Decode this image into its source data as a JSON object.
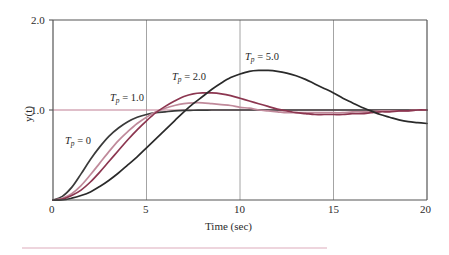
{
  "figure": {
    "background": "#ffffff",
    "axis_color": "#555555",
    "grid_color": "#9a9a9a",
    "reference_line_color": "#c07f93",
    "footer_rule_color": "#e9c7d2"
  },
  "axes": {
    "x_title": "Time (sec)",
    "y_title": "y(t)",
    "x_ticks": [
      "0",
      "5",
      "10",
      "15",
      "20"
    ],
    "y_ticks": [
      "1.0",
      "2.0"
    ]
  },
  "curve_labels": [
    {
      "id": "tp0",
      "prefix": "T",
      "sub": "p",
      "eq": " = 0",
      "x": 65,
      "y": 135
    },
    {
      "id": "tp1",
      "prefix": "T",
      "sub": "p",
      "eq": " = 1.0",
      "x": 110,
      "y": 92
    },
    {
      "id": "tp2",
      "prefix": "T",
      "sub": "p",
      "eq": " = 2.0",
      "x": 172,
      "y": 71
    },
    {
      "id": "tp5",
      "prefix": "T",
      "sub": "p",
      "eq": " = 5.0",
      "x": 245,
      "y": 51
    }
  ],
  "chart_data": {
    "type": "line",
    "title": "",
    "xlabel": "Time (sec)",
    "ylabel": "y(t)",
    "xlim": [
      0,
      20
    ],
    "ylim": [
      0,
      2.0
    ],
    "xticks": [
      0,
      5,
      10,
      15,
      20
    ],
    "yticks": [
      1.0,
      2.0
    ],
    "grid": "vertical gridlines at x = 5, 10, 15",
    "legend": "inline curve annotations",
    "reference_lines": [
      {
        "name": "unity-reference",
        "y": 1.0,
        "color": "#c07f93"
      }
    ],
    "x": [
      0,
      0.5,
      1,
      1.5,
      2,
      2.5,
      3,
      3.5,
      4,
      4.5,
      5,
      5.5,
      6,
      6.5,
      7,
      7.5,
      8,
      8.5,
      9,
      9.5,
      10,
      10.5,
      11,
      11.5,
      12,
      12.5,
      13,
      13.5,
      14,
      14.5,
      15,
      15.5,
      16,
      16.5,
      17,
      17.5,
      18,
      18.5,
      19,
      19.5,
      20
    ],
    "series": [
      {
        "name": "Tp = 0",
        "label": "T_p = 0",
        "color": "#3a3a3a",
        "values": [
          0,
          0.04,
          0.14,
          0.29,
          0.45,
          0.59,
          0.71,
          0.8,
          0.87,
          0.92,
          0.95,
          0.97,
          0.98,
          0.99,
          0.995,
          0.997,
          0.999,
          1.0,
          1.0,
          1.0,
          1.0,
          1.0,
          1.0,
          1.0,
          1.0,
          1.0,
          1.0,
          1.0,
          1.0,
          1.0,
          1.0,
          1.0,
          1.0,
          1.0,
          1.0,
          1.0,
          1.0,
          1.0,
          1.0,
          1.0,
          1.0
        ]
      },
      {
        "name": "Tp = 1.0",
        "label": "T_p = 1.0",
        "color": "#c08a9b",
        "values": [
          0,
          0.02,
          0.07,
          0.16,
          0.28,
          0.41,
          0.54,
          0.66,
          0.76,
          0.85,
          0.92,
          0.98,
          1.02,
          1.05,
          1.07,
          1.08,
          1.08,
          1.07,
          1.06,
          1.05,
          1.03,
          1.02,
          1.0,
          0.99,
          0.98,
          0.97,
          0.97,
          0.97,
          0.97,
          0.97,
          0.97,
          0.97,
          0.98,
          0.98,
          0.98,
          0.99,
          0.99,
          0.99,
          0.99,
          1.0,
          1.0
        ]
      },
      {
        "name": "Tp = 2.0",
        "label": "T_p = 2.0",
        "color": "#8c3650",
        "values": [
          0,
          0.01,
          0.05,
          0.11,
          0.2,
          0.31,
          0.43,
          0.55,
          0.67,
          0.78,
          0.88,
          0.97,
          1.04,
          1.1,
          1.15,
          1.18,
          1.19,
          1.19,
          1.18,
          1.16,
          1.13,
          1.1,
          1.07,
          1.04,
          1.01,
          0.99,
          0.97,
          0.96,
          0.95,
          0.95,
          0.95,
          0.95,
          0.96,
          0.96,
          0.97,
          0.98,
          0.98,
          0.99,
          0.99,
          1.0,
          1.0
        ]
      },
      {
        "name": "Tp = 5.0",
        "label": "T_p = 5.0",
        "color": "#2a2a2a",
        "values": [
          0,
          0.0,
          0.02,
          0.05,
          0.09,
          0.15,
          0.22,
          0.3,
          0.39,
          0.48,
          0.58,
          0.68,
          0.78,
          0.88,
          0.98,
          1.07,
          1.15,
          1.23,
          1.3,
          1.36,
          1.4,
          1.43,
          1.44,
          1.44,
          1.43,
          1.41,
          1.38,
          1.34,
          1.29,
          1.24,
          1.19,
          1.13,
          1.08,
          1.03,
          0.99,
          0.95,
          0.92,
          0.89,
          0.87,
          0.86,
          0.85
        ]
      }
    ]
  }
}
